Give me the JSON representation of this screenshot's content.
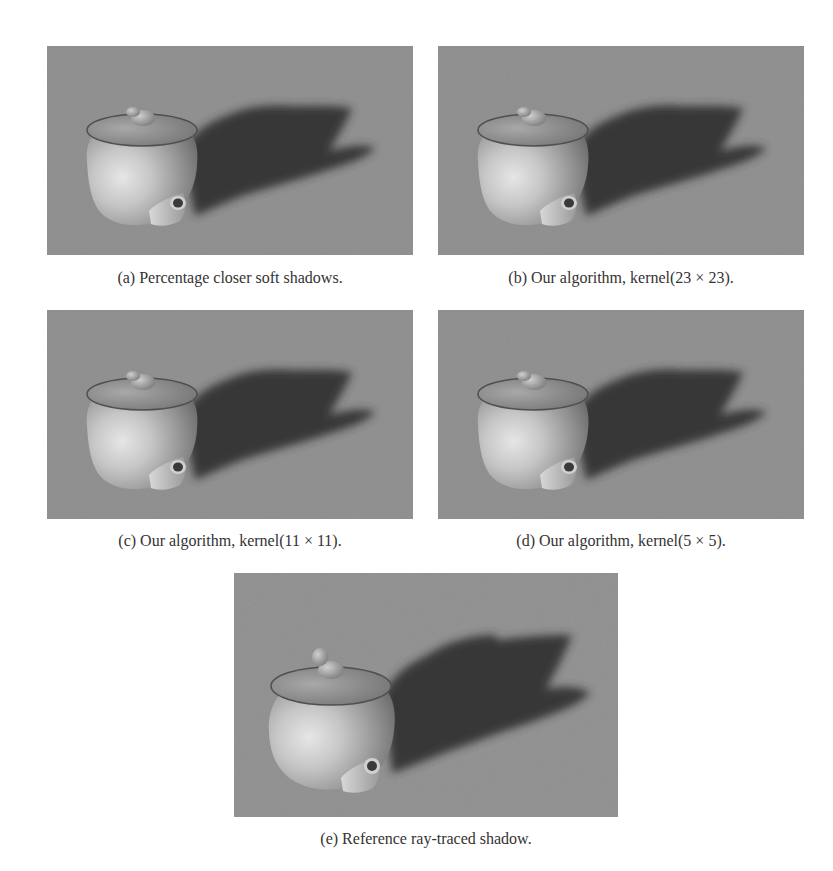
{
  "figure": {
    "background_color": "#ffffff",
    "floor_color": "#8d8d8d",
    "shadow_color": "#2e2e2e",
    "subfigures": [
      {
        "id": "a",
        "label": "(a)",
        "caption": "(a) Percentage closer soft shadows.",
        "image": "teapot-render-pcss"
      },
      {
        "id": "b",
        "label": "(b)",
        "caption": "(b) Our algorithm, kernel(23 × 23).",
        "image": "teapot-render-kernel-23"
      },
      {
        "id": "c",
        "label": "(c)",
        "caption": "(c) Our algorithm, kernel(11 × 11).",
        "image": "teapot-render-kernel-11"
      },
      {
        "id": "d",
        "label": "(d)",
        "caption": "(d) Our algorithm, kernel(5 × 5).",
        "image": "teapot-render-kernel-5"
      },
      {
        "id": "e",
        "label": "(e)",
        "caption": "(e) Reference ray-traced shadow.",
        "image": "teapot-render-raytraced"
      }
    ]
  }
}
